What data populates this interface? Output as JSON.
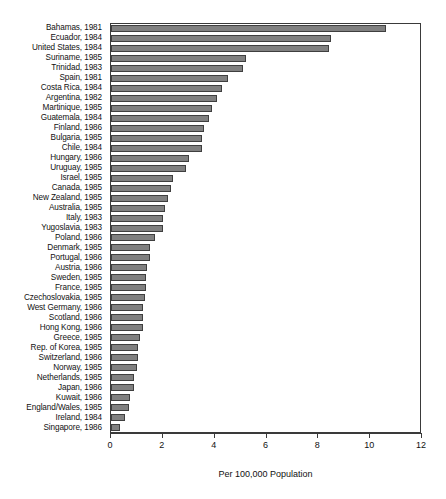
{
  "chart_data": {
    "type": "bar",
    "orientation": "horizontal",
    "title": "",
    "xlabel": "Per 100,000 Population",
    "ylabel": "",
    "xlim": [
      0,
      12
    ],
    "xticks": [
      0,
      2,
      4,
      6,
      8,
      10,
      12
    ],
    "grid": false,
    "legend": null,
    "categories": [
      "Bahamas, 1981",
      "Ecuador, 1984",
      "United States, 1984",
      "Suriname, 1985",
      "Trinidad, 1983",
      "Spain, 1981",
      "Costa Rica, 1984",
      "Argentina, 1982",
      "Martinique, 1985",
      "Guatemala, 1984",
      "Finland, 1986",
      "Bulgaria, 1985",
      "Chile, 1984",
      "Hungary, 1986",
      "Uruguay, 1985",
      "Israel, 1985",
      "Canada, 1985",
      "New Zealand, 1985",
      "Australia, 1985",
      "Italy, 1983",
      "Yugoslavia, 1983",
      "Poland, 1986",
      "Denmark, 1985",
      "Portugal, 1986",
      "Austria, 1986",
      "Sweden, 1985",
      "France, 1985",
      "Czechoslovakia, 1985",
      "West Germany, 1986",
      "Scotland, 1986",
      "Hong Kong, 1986",
      "Greece, 1985",
      "Rep. of Korea, 1985",
      "Switzerland, 1986",
      "Norway, 1985",
      "Netherlands, 1985",
      "Japan, 1986",
      "Kuwait, 1986",
      "England/Wales, 1985",
      "Ireland, 1984",
      "Singapore, 1986"
    ],
    "values": [
      10.6,
      8.5,
      8.4,
      5.2,
      5.1,
      4.5,
      4.3,
      4.1,
      3.9,
      3.8,
      3.6,
      3.5,
      3.5,
      3.0,
      2.9,
      2.4,
      2.3,
      2.2,
      2.1,
      2.0,
      2.0,
      1.7,
      1.5,
      1.5,
      1.4,
      1.35,
      1.35,
      1.3,
      1.25,
      1.25,
      1.25,
      1.1,
      1.05,
      1.05,
      1.0,
      0.9,
      0.9,
      0.75,
      0.7,
      0.55,
      0.35
    ],
    "bar_color": "#808080",
    "bar_edge_color": "#3f3f3f",
    "axis_color": "#3a3a3a"
  }
}
